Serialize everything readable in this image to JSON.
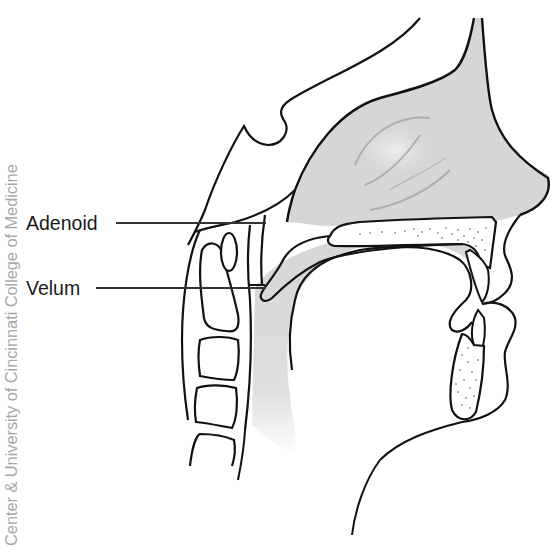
{
  "figure": {
    "type": "anatomical sagittal cross-section of head (nasal cavity, oral cavity, pharynx)",
    "watermark": "Center & University of Cincinnati College of Medicine",
    "labels": [
      {
        "text": "Adenoid",
        "leader_from": [
          116,
          223
        ],
        "leader_to": [
          265,
          220
        ]
      },
      {
        "text": "Velum",
        "leader_from": [
          96,
          288
        ],
        "leader_to": [
          265,
          286
        ]
      }
    ],
    "colors": {
      "outline": "#111111",
      "airway_fill": "#d4d6d7",
      "bone_fill": "#ffffff",
      "background": "#ffffff",
      "label_text": "#1a1a1a",
      "watermark_text": "#a8a8a8"
    }
  }
}
